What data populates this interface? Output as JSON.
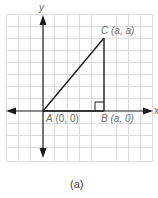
{
  "figure": {
    "caption": "(a)",
    "axes": {
      "x_label": "x",
      "y_label": "y"
    },
    "points": {
      "A": {
        "name": "A",
        "coords": "(0, 0)"
      },
      "B": {
        "name": "B",
        "coords": "(a, 0)"
      },
      "C": {
        "name": "C",
        "coords": "(a, a)"
      }
    },
    "shape": "right isosceles triangle ABC with right angle at B",
    "colors": {
      "grid": "#dcdcdc",
      "lines": "#1a1a1a",
      "labels": "#6e6e6e"
    }
  }
}
